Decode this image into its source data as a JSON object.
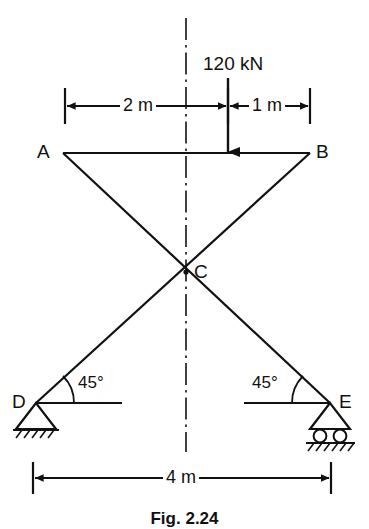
{
  "figure": {
    "caption": "Fig. 2.24",
    "type": "truss-free-body-diagram"
  },
  "nodes": {
    "a": "A",
    "b": "B",
    "c": "C",
    "d": "D",
    "e": "E"
  },
  "load": {
    "label": "120 kN",
    "direction": "down",
    "applied_at": "top-chord"
  },
  "dimensions": {
    "left_span": "2 m",
    "right_span": "1 m",
    "base_span": "4 m"
  },
  "angles": {
    "left": "45°",
    "right": "45°"
  },
  "supports": {
    "left_type": "pinned",
    "right_type": "roller"
  },
  "colors": {
    "line": "#111111",
    "background": "#ffffff"
  }
}
